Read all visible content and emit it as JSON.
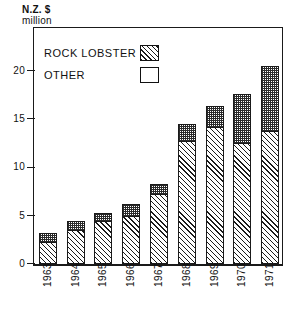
{
  "chart_data": {
    "type": "bar",
    "subtype": "stacked-vertical",
    "title": "",
    "subtitle": "",
    "xlabel": "",
    "ylabel": "N.Z. $ million",
    "ylabel_lines": [
      "N.Z. $",
      "million"
    ],
    "categories": [
      "1963",
      "1964",
      "1965",
      "1966",
      "1967",
      "1968",
      "1969",
      "1970",
      "1971"
    ],
    "series": [
      {
        "name": "ROCK LOBSTER",
        "pattern": "diagonal-hatch",
        "values": [
          2.3,
          3.5,
          4.4,
          5.0,
          7.2,
          12.7,
          14.2,
          12.5,
          13.7
        ]
      },
      {
        "name": "OTHER",
        "pattern": "open-white",
        "values": [
          0.9,
          0.9,
          0.9,
          1.2,
          1.1,
          1.8,
          2.1,
          5.1,
          6.8
        ]
      }
    ],
    "totals": [
      3.2,
      4.4,
      5.3,
      6.2,
      8.3,
      14.5,
      16.3,
      17.6,
      20.5
    ],
    "ylim": [
      0,
      24.5
    ],
    "yticks": [
      0,
      5,
      10,
      15,
      20
    ],
    "ytick_labels": [
      "0",
      "5",
      "10",
      "15",
      "20"
    ],
    "grid": false,
    "legend_position": "inside-top-left",
    "legend": [
      {
        "label": "ROCK LOBSTER",
        "swatch": "hatched-swatch"
      },
      {
        "label": "OTHER",
        "swatch": "open-swatch"
      }
    ],
    "colors": {
      "ink": "#1a1a1a",
      "background": "#ffffff"
    }
  }
}
